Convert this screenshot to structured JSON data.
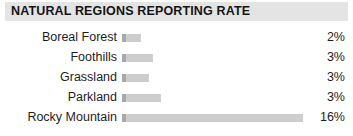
{
  "header": {
    "title": "NATURAL REGIONS REPORTING RATE",
    "background_color": "#e4e4e4"
  },
  "colors": {
    "bar_fill": "#cdcdcd",
    "bar_cap": "#a8a8a8",
    "text": "#1d1d1d",
    "page_background": "#ffffff"
  },
  "chart_data": {
    "type": "bar",
    "title": "NATURAL REGIONS REPORTING RATE",
    "xlabel": "",
    "ylabel": "",
    "orientation": "horizontal",
    "grid": false,
    "legend": false,
    "xlim": [
      0,
      16
    ],
    "value_suffix": "%",
    "categories": [
      "Boreal Forest",
      "Foothills",
      "Grassland",
      "Parkland",
      "Rocky Mountain"
    ],
    "values": [
      2,
      3,
      3,
      3,
      16
    ],
    "labels": [
      "2%",
      "3%",
      "3%",
      "3%",
      "16%"
    ]
  },
  "rows": [
    {
      "label": "Boreal Forest",
      "value": "2%",
      "bar_width_px": 19
    },
    {
      "label": "Foothills",
      "value": "3%",
      "bar_width_px": 31
    },
    {
      "label": "Grassland",
      "value": "3%",
      "bar_width_px": 27
    },
    {
      "label": "Parkland",
      "value": "3%",
      "bar_width_px": 39
    },
    {
      "label": "Rocky Mountain",
      "value": "16%",
      "bar_width_px": 181
    }
  ]
}
